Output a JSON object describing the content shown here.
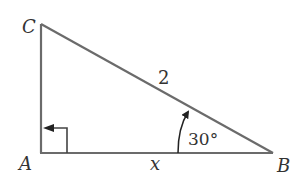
{
  "diagram": {
    "type": "right-triangle",
    "colors": {
      "stroke": "#6b6b6b",
      "text": "#333333",
      "background": "#ffffff"
    },
    "vertices": {
      "A": {
        "label": "A",
        "note": "right angle"
      },
      "B": {
        "label": "B",
        "angle": "30°"
      },
      "C": {
        "label": "C"
      }
    },
    "sides": {
      "hypotenuse_CB": {
        "label": "2"
      },
      "base_AB": {
        "label": "x"
      }
    },
    "angle_label": "30°"
  }
}
